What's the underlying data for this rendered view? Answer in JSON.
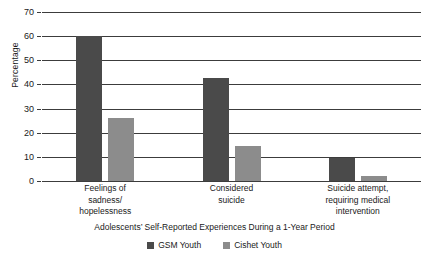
{
  "chart_data": {
    "type": "bar",
    "title": "",
    "xlabel": "Adolescents’ Self-Reported Experiences During a 1-Year Period",
    "ylabel": "Percentage",
    "categories": [
      "Feelings of sadness/ hopelessness",
      "Considered suicide",
      "Suicide attempt, requiring medical intervention"
    ],
    "category_lines": [
      [
        "Feelings of",
        "sadness/",
        "hopelessness"
      ],
      [
        "Considered",
        "suicide"
      ],
      [
        "Suicide attempt,",
        "requiring medical",
        "intervention"
      ]
    ],
    "series": [
      {
        "name": "GSM Youth",
        "color": "#4a4a4a",
        "values": [
          60,
          42.5,
          9.5
        ]
      },
      {
        "name": "Cishet Youth",
        "color": "#8c8c8c",
        "values": [
          26,
          14.5,
          2
        ]
      }
    ],
    "ylim": [
      0,
      70
    ],
    "yticks": [
      0,
      10,
      20,
      30,
      40,
      50,
      60,
      70
    ],
    "ytick_labels": [
      "0",
      "10",
      "20",
      "30",
      "40",
      "50",
      "60",
      "70"
    ],
    "grid": true,
    "legend_position": "bottom",
    "gridline_color": "#3c3c3c",
    "background": "#ffffff"
  },
  "legend": {
    "entries": [
      {
        "label": "GSM Youth",
        "color": "#4a4a4a"
      },
      {
        "label": "Cishet Youth",
        "color": "#8c8c8c"
      }
    ]
  }
}
